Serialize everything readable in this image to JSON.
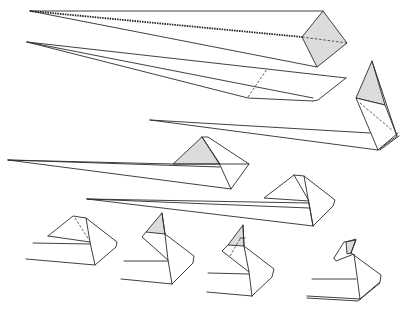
{
  "diagram": {
    "title": "Origami folding sequence",
    "colors": {
      "background": "#ffffff",
      "line": "#2a2a2a",
      "shaded_face": "#dcdcdc",
      "paper_face": "#ffffff"
    },
    "steps": [
      {
        "id": 1,
        "description": "Long narrow point with square diamond end, shaded; dotted mountain crease along upper edge; dashed valley diagonal across diamond"
      },
      {
        "id": 2,
        "description": "Long flap with valley-fold dashed line near the right end"
      },
      {
        "id": 3,
        "description": "Point folded up; shaded triangle on top, dashed diagonal fold line below"
      },
      {
        "id": 4,
        "description": "Long point with pyramid-shaped end, left face shaded"
      },
      {
        "id": 5,
        "description": "Long point with pyramid-shaped end, unshaded"
      },
      {
        "id": 6,
        "description": "Head shape with dashed crease on left face"
      },
      {
        "id": 7,
        "description": "Head folded up with shaded triangular tip"
      },
      {
        "id": 8,
        "description": "Shaded tip with dashed crease line"
      },
      {
        "id": 9,
        "description": "Finished head with beak-like tip folded"
      }
    ]
  }
}
